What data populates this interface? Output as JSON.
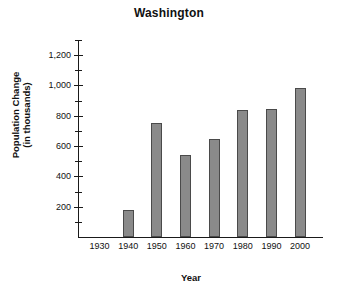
{
  "chart_data": {
    "type": "bar",
    "title": "Washington",
    "xlabel": "Year",
    "ylabel_line1": "Population Change",
    "ylabel_line2": "(in thousands)",
    "categories": [
      "1930",
      "1940",
      "1950",
      "1960",
      "1970",
      "1980",
      "1990",
      "2000"
    ],
    "values": [
      0,
      180,
      750,
      540,
      645,
      840,
      845,
      985
    ],
    "ylim": [
      0,
      1300
    ],
    "ytick_values": [
      200,
      400,
      600,
      800,
      1000,
      1200
    ],
    "ytick_labels": [
      "200",
      "400",
      "600",
      "800",
      "1,000",
      "1,200"
    ],
    "yminor_values": [
      100,
      300,
      500,
      700,
      900,
      1100,
      1300
    ],
    "grid": false,
    "legend": "none",
    "bar_fill": "#8a8a8a",
    "bar_border": "#4a4a4a",
    "axis_color": "#1a1a1a",
    "background": "#ffffff"
  }
}
